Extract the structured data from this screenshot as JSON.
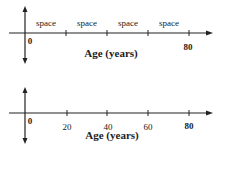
{
  "diagrams": [
    {
      "interval_labels": [
        "space",
        "space",
        "space",
        "space"
      ],
      "origin_label": "0",
      "end_label": "80",
      "axis_title": "Age (years)"
    },
    {
      "origin_label": "0",
      "tick_labels": [
        "20",
        "40",
        "60",
        "80"
      ],
      "axis_title": "Age (years)"
    }
  ],
  "colors": {
    "axis": "#222222",
    "background": "#ffffff"
  }
}
